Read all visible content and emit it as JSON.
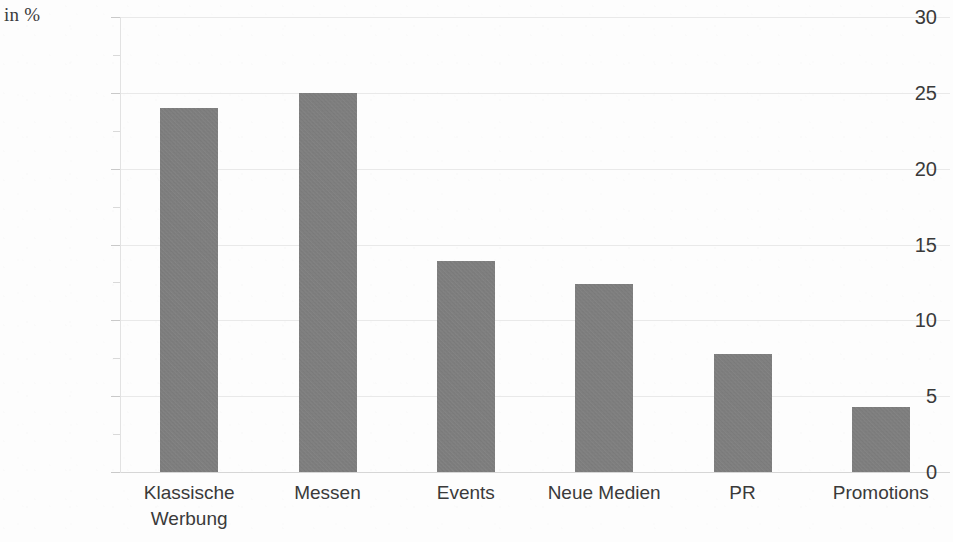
{
  "unit_label": "in %",
  "chart_data": {
    "type": "bar",
    "title": "",
    "subtitle": "",
    "xlabel": "",
    "ylabel": "in %",
    "ylim": [
      0,
      30
    ],
    "y_ticks": [
      0,
      5,
      10,
      15,
      20,
      25,
      30
    ],
    "y_tick_labels": [
      "0",
      "5",
      "10",
      "15",
      "20",
      "25",
      "30"
    ],
    "grid": true,
    "grid_axis": "y",
    "legend": false,
    "bar_color": "#808080",
    "categories": [
      "Klassische Werbung",
      "Messen",
      "Events",
      "Neue Medien",
      "PR",
      "Promotions"
    ],
    "category_lines": [
      [
        "Klassische",
        "Werbung"
      ],
      [
        "Messen"
      ],
      [
        "Events"
      ],
      [
        "Neue Medien"
      ],
      [
        "PR"
      ],
      [
        "Promotions"
      ]
    ],
    "values": [
      24.0,
      25.0,
      13.9,
      12.4,
      7.8,
      4.3
    ]
  }
}
